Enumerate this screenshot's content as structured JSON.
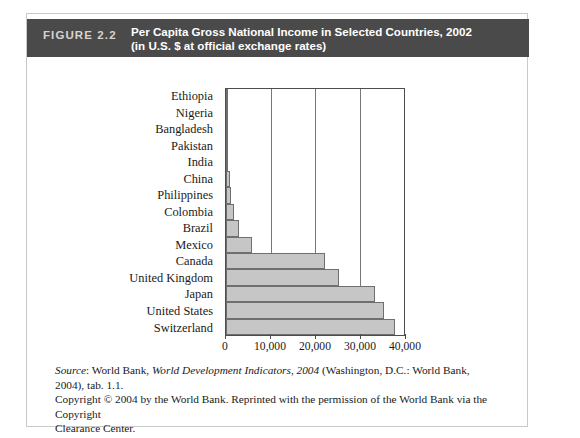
{
  "figure": {
    "label": "FIGURE 2.2",
    "title_line1": "Per Capita Gross National Income in Selected Countries, 2002",
    "title_line2": "(in U.S. $ at official exchange rates)",
    "band_color": "#4a4a4a",
    "label_color": "#d8d4cc",
    "bar_fill": "#c6c6c6",
    "bar_stroke": "#6f6f6f"
  },
  "source": {
    "prefix": "Source",
    "line1_a": ": World Bank, ",
    "line1_italic": "World Development Indicators, 2004",
    "line1_b": " (Washington, D.C.: World Bank, 2004), tab. 1.1.",
    "line2": "Copyright © 2004 by the World Bank. Reprinted with the permission of the World Bank via the Copyright",
    "line3": "Clearance Center."
  },
  "chart_data": {
    "type": "bar",
    "orientation": "horizontal",
    "title": "Per Capita Gross National Income in Selected Countries, 2002 (in U.S. $ at official exchange rates)",
    "xlabel": "",
    "ylabel": "",
    "xlim": [
      0,
      40000
    ],
    "grid": true,
    "legend": "none",
    "xticks": [
      0,
      10000,
      20000,
      30000,
      40000
    ],
    "xticklabels": [
      "0",
      "10,000",
      "20,000",
      "30,000",
      "40,000"
    ],
    "categories": [
      "Ethiopia",
      "Nigeria",
      "Bangladesh",
      "Pakistan",
      "India",
      "China",
      "Philippines",
      "Colombia",
      "Brazil",
      "Mexico",
      "Canada",
      "United Kingdom",
      "Japan",
      "United States",
      "Switzerland"
    ],
    "values": [
      100,
      300,
      380,
      410,
      480,
      960,
      1030,
      1820,
      2850,
      5910,
      22300,
      25500,
      33500,
      35400,
      37900
    ]
  }
}
